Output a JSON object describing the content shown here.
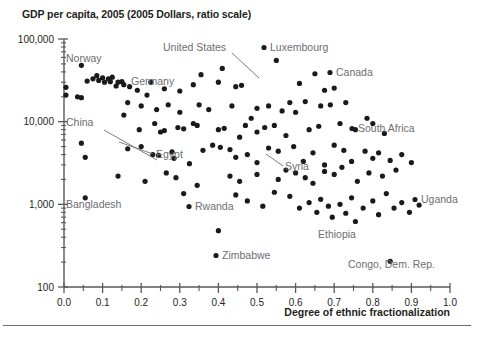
{
  "chart_data": {
    "type": "scatter",
    "title": "GDP per capita, 2005 (2005 Dollars, ratio scale)",
    "xlabel": "Degree of ethnic fractionalization",
    "ylabel": "GDP per capita, 2005 (2005 Dollars, ratio scale)",
    "yscale": "log",
    "xlim": [
      0.0,
      1.0
    ],
    "ylim": [
      100,
      100000
    ],
    "grid": false,
    "legend": "none",
    "xticks": [
      "0.0",
      "0.1",
      "0.2",
      "0.3",
      "0.4",
      "0.5",
      "0.6",
      "0.7",
      "0.8",
      "0.9",
      "1.0"
    ],
    "xtick_values": [
      0.0,
      0.1,
      0.2,
      0.3,
      0.4,
      0.5,
      0.6,
      0.7,
      0.8,
      0.9,
      1.0
    ],
    "yticks": [
      "100,000",
      "10,000",
      "1,000",
      "100"
    ],
    "ytick_values": [
      100000,
      10000,
      1000,
      100
    ],
    "points": [
      {
        "x": 0.005,
        "y": 26000
      },
      {
        "x": 0.005,
        "y": 21000
      },
      {
        "x": 0.045,
        "y": 48000
      },
      {
        "x": 0.06,
        "y": 31000
      },
      {
        "x": 0.075,
        "y": 33000
      },
      {
        "x": 0.085,
        "y": 36000
      },
      {
        "x": 0.09,
        "y": 31500
      },
      {
        "x": 0.1,
        "y": 34000
      },
      {
        "x": 0.105,
        "y": 30000
      },
      {
        "x": 0.115,
        "y": 33000
      },
      {
        "x": 0.12,
        "y": 30500
      },
      {
        "x": 0.125,
        "y": 34500
      },
      {
        "x": 0.135,
        "y": 27000
      },
      {
        "x": 0.14,
        "y": 30000
      },
      {
        "x": 0.15,
        "y": 30500
      },
      {
        "x": 0.155,
        "y": 28000
      },
      {
        "x": 0.035,
        "y": 20000
      },
      {
        "x": 0.045,
        "y": 19500
      },
      {
        "x": 0.17,
        "y": 26500
      },
      {
        "x": 0.19,
        "y": 24000
      },
      {
        "x": 0.225,
        "y": 30000
      },
      {
        "x": 0.215,
        "y": 21000
      },
      {
        "x": 0.26,
        "y": 25000
      },
      {
        "x": 0.3,
        "y": 23500
      },
      {
        "x": 0.335,
        "y": 28000
      },
      {
        "x": 0.355,
        "y": 37000
      },
      {
        "x": 0.4,
        "y": 30000
      },
      {
        "x": 0.41,
        "y": 44000
      },
      {
        "x": 0.445,
        "y": 26500
      },
      {
        "x": 0.46,
        "y": 27500
      },
      {
        "x": 0.55,
        "y": 55000
      },
      {
        "x": 0.61,
        "y": 29000
      },
      {
        "x": 0.65,
        "y": 38000
      },
      {
        "x": 0.675,
        "y": 24000
      },
      {
        "x": 0.7,
        "y": 25500
      },
      {
        "x": 0.165,
        "y": 17000
      },
      {
        "x": 0.2,
        "y": 15500
      },
      {
        "x": 0.24,
        "y": 14000
      },
      {
        "x": 0.27,
        "y": 16000
      },
      {
        "x": 0.3,
        "y": 13000
      },
      {
        "x": 0.335,
        "y": 9500
      },
      {
        "x": 0.35,
        "y": 16000
      },
      {
        "x": 0.375,
        "y": 14000
      },
      {
        "x": 0.435,
        "y": 15500
      },
      {
        "x": 0.485,
        "y": 11000
      },
      {
        "x": 0.5,
        "y": 14500
      },
      {
        "x": 0.53,
        "y": 15500
      },
      {
        "x": 0.565,
        "y": 13500
      },
      {
        "x": 0.585,
        "y": 17000
      },
      {
        "x": 0.6,
        "y": 13000
      },
      {
        "x": 0.625,
        "y": 17500
      },
      {
        "x": 0.665,
        "y": 15500
      },
      {
        "x": 0.69,
        "y": 16000
      },
      {
        "x": 0.73,
        "y": 17000
      },
      {
        "x": 0.785,
        "y": 11000
      },
      {
        "x": 0.155,
        "y": 12000
      },
      {
        "x": 0.195,
        "y": 8000
      },
      {
        "x": 0.235,
        "y": 9500
      },
      {
        "x": 0.25,
        "y": 7500
      },
      {
        "x": 0.26,
        "y": 7800
      },
      {
        "x": 0.295,
        "y": 8500
      },
      {
        "x": 0.31,
        "y": 8200
      },
      {
        "x": 0.345,
        "y": 9000
      },
      {
        "x": 0.4,
        "y": 8000
      },
      {
        "x": 0.415,
        "y": 8300
      },
      {
        "x": 0.455,
        "y": 6500
      },
      {
        "x": 0.47,
        "y": 9000
      },
      {
        "x": 0.5,
        "y": 7500
      },
      {
        "x": 0.52,
        "y": 8500
      },
      {
        "x": 0.545,
        "y": 9000
      },
      {
        "x": 0.575,
        "y": 6800
      },
      {
        "x": 0.635,
        "y": 8000
      },
      {
        "x": 0.66,
        "y": 8800
      },
      {
        "x": 0.715,
        "y": 9500
      },
      {
        "x": 0.755,
        "y": 8000
      },
      {
        "x": 0.8,
        "y": 9500
      },
      {
        "x": 0.83,
        "y": 7200
      },
      {
        "x": 0.045,
        "y": 5500
      },
      {
        "x": 0.055,
        "y": 3700
      },
      {
        "x": 0.165,
        "y": 4700
      },
      {
        "x": 0.2,
        "y": 5000
      },
      {
        "x": 0.23,
        "y": 4000
      },
      {
        "x": 0.245,
        "y": 3900
      },
      {
        "x": 0.28,
        "y": 4300
      },
      {
        "x": 0.285,
        "y": 3600
      },
      {
        "x": 0.325,
        "y": 3100
      },
      {
        "x": 0.36,
        "y": 4500
      },
      {
        "x": 0.385,
        "y": 5200
      },
      {
        "x": 0.405,
        "y": 4900
      },
      {
        "x": 0.43,
        "y": 4600
      },
      {
        "x": 0.445,
        "y": 3700
      },
      {
        "x": 0.475,
        "y": 4000
      },
      {
        "x": 0.5,
        "y": 3200
      },
      {
        "x": 0.53,
        "y": 4800
      },
      {
        "x": 0.555,
        "y": 4400
      },
      {
        "x": 0.595,
        "y": 5000
      },
      {
        "x": 0.62,
        "y": 3300
      },
      {
        "x": 0.645,
        "y": 4200
      },
      {
        "x": 0.675,
        "y": 3000
      },
      {
        "x": 0.7,
        "y": 5200
      },
      {
        "x": 0.725,
        "y": 4500
      },
      {
        "x": 0.745,
        "y": 3300
      },
      {
        "x": 0.78,
        "y": 4400
      },
      {
        "x": 0.8,
        "y": 3600
      },
      {
        "x": 0.815,
        "y": 4200
      },
      {
        "x": 0.845,
        "y": 3400
      },
      {
        "x": 0.875,
        "y": 4000
      },
      {
        "x": 0.9,
        "y": 3200
      },
      {
        "x": 0.14,
        "y": 2200
      },
      {
        "x": 0.21,
        "y": 1900
      },
      {
        "x": 0.265,
        "y": 2400
      },
      {
        "x": 0.29,
        "y": 2100
      },
      {
        "x": 0.345,
        "y": 1700
      },
      {
        "x": 0.43,
        "y": 2200
      },
      {
        "x": 0.455,
        "y": 1900
      },
      {
        "x": 0.5,
        "y": 2300
      },
      {
        "x": 0.555,
        "y": 2000
      },
      {
        "x": 0.575,
        "y": 2600
      },
      {
        "x": 0.6,
        "y": 2400
      },
      {
        "x": 0.625,
        "y": 2100
      },
      {
        "x": 0.645,
        "y": 1800
      },
      {
        "x": 0.675,
        "y": 2500
      },
      {
        "x": 0.7,
        "y": 2300
      },
      {
        "x": 0.72,
        "y": 2800
      },
      {
        "x": 0.76,
        "y": 1900
      },
      {
        "x": 0.79,
        "y": 2400
      },
      {
        "x": 0.825,
        "y": 2200
      },
      {
        "x": 0.86,
        "y": 2600
      },
      {
        "x": 0.055,
        "y": 1200
      },
      {
        "x": 0.31,
        "y": 1350
      },
      {
        "x": 0.4,
        "y": 480
      },
      {
        "x": 0.445,
        "y": 1300
      },
      {
        "x": 0.475,
        "y": 1100
      },
      {
        "x": 0.515,
        "y": 950
      },
      {
        "x": 0.545,
        "y": 1400
      },
      {
        "x": 0.585,
        "y": 1250
      },
      {
        "x": 0.61,
        "y": 900
      },
      {
        "x": 0.635,
        "y": 1050
      },
      {
        "x": 0.655,
        "y": 800
      },
      {
        "x": 0.665,
        "y": 1150
      },
      {
        "x": 0.685,
        "y": 950
      },
      {
        "x": 0.695,
        "y": 700
      },
      {
        "x": 0.715,
        "y": 1000
      },
      {
        "x": 0.73,
        "y": 780
      },
      {
        "x": 0.745,
        "y": 1200
      },
      {
        "x": 0.755,
        "y": 620
      },
      {
        "x": 0.775,
        "y": 900
      },
      {
        "x": 0.8,
        "y": 1100
      },
      {
        "x": 0.815,
        "y": 750
      },
      {
        "x": 0.835,
        "y": 1350
      },
      {
        "x": 0.855,
        "y": 900
      },
      {
        "x": 0.875,
        "y": 1050
      },
      {
        "x": 0.895,
        "y": 800
      },
      {
        "x": 0.92,
        "y": 980
      },
      {
        "x": 0.845,
        "y": 205
      }
    ],
    "annotations": [
      {
        "label": "Norway",
        "text_x": 66,
        "text_y": 62,
        "style": "plain"
      },
      {
        "label": "Germany",
        "text_x": 131,
        "text_y": 85,
        "style": "plain"
      },
      {
        "label": "China",
        "text_x": 66,
        "text_y": 126,
        "style": "leader",
        "line": [
          [
            104,
            130
          ],
          [
            157,
            160
          ]
        ]
      },
      {
        "label": "Bangladesh",
        "text_x": 66,
        "text_y": 208,
        "style": "plain"
      },
      {
        "label": "Egypt",
        "text_x": 156,
        "text_y": 158,
        "style": "leader",
        "line": [
          [
            153,
            154
          ],
          [
            119,
            142
          ]
        ]
      },
      {
        "label": "United States",
        "text_x": 163,
        "text_y": 51,
        "style": "leader",
        "line": [
          [
            232,
            53
          ],
          [
            259,
            78
          ]
        ]
      },
      {
        "label": "Luxembourg",
        "text_x": 264,
        "text_y": 51,
        "style": "bullet"
      },
      {
        "label": "Canada",
        "text_x": 330,
        "text_y": 76,
        "style": "bullet"
      },
      {
        "label": "South Africa",
        "text_x": 352,
        "text_y": 132,
        "style": "bullet"
      },
      {
        "label": "Syria",
        "text_x": 285,
        "text_y": 170,
        "style": "leader",
        "line": [
          [
            283,
            166
          ],
          [
            266,
            154
          ]
        ]
      },
      {
        "label": "Rwanda",
        "text_x": 189,
        "text_y": 210,
        "style": "bullet"
      },
      {
        "label": "Zimbabwe",
        "text_x": 216,
        "text_y": 259,
        "style": "bullet"
      },
      {
        "label": "Ethiopia",
        "text_x": 318,
        "text_y": 238,
        "style": "plain"
      },
      {
        "label": "Uganda",
        "text_x": 415,
        "text_y": 203,
        "style": "bullet"
      },
      {
        "label": "Congo, Dem. Rep.",
        "text_x": 348,
        "text_y": 268,
        "style": "plain"
      }
    ]
  },
  "figure": {
    "title": "GDP per capita, 2005 (2005 Dollars, ratio scale)",
    "x_axis_caption": "Degree of ethnic fractionalization",
    "colors": {
      "point": "#1a1a1a",
      "axis": "#58595b",
      "label": "#6d6e71",
      "title": "#231f20",
      "background": "#ffffff"
    }
  }
}
